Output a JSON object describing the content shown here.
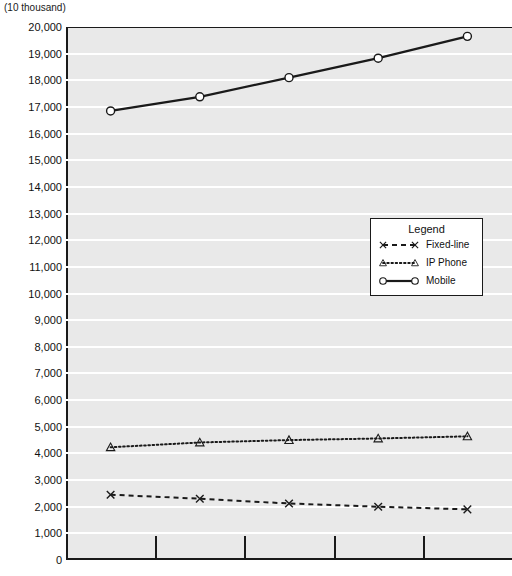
{
  "axis_unit_label": "(10 thousand)",
  "legend": {
    "title": "Legend",
    "items": [
      {
        "label": "Fixed-line",
        "marker": "x-marker-icon",
        "line": "dashed"
      },
      {
        "label": "IP Phone",
        "marker": "triangle-marker-icon",
        "line": "dotted"
      },
      {
        "label": "Mobile",
        "marker": "circle-marker-icon",
        "line": "solid"
      }
    ]
  },
  "chart_data": {
    "type": "line",
    "title": "",
    "xlabel": "",
    "ylabel": "(10 thousand)",
    "ylim": [
      0,
      20000
    ],
    "ytick_step": 1000,
    "ytick_labels": [
      "20,000",
      "19,000",
      "18,000",
      "17,000",
      "16,000",
      "15,000",
      "14,000",
      "13,000",
      "12,000",
      "11,000",
      "10,000",
      "9,000",
      "8,000",
      "7,000",
      "6,000",
      "5,000",
      "4,000",
      "3,000",
      "2,000",
      "1,000",
      "0"
    ],
    "grid": true,
    "legend_position": "center-right",
    "x": [
      1,
      2,
      3,
      4,
      5
    ],
    "categories": [
      "",
      "",
      "",
      "",
      ""
    ],
    "series": [
      {
        "name": "Fixed-line",
        "marker": "x",
        "linestyle": "dashed",
        "color": "#1a1a1a",
        "values": [
          2450,
          2300,
          2120,
          2000,
          1900
        ]
      },
      {
        "name": "IP Phone",
        "marker": "triangle",
        "linestyle": "dotted",
        "color": "#1a1a1a",
        "values": [
          4230,
          4410,
          4500,
          4560,
          4640
        ]
      },
      {
        "name": "Mobile",
        "marker": "circle",
        "linestyle": "solid",
        "color": "#1a1a1a",
        "values": [
          16850,
          17380,
          18100,
          18830,
          19650
        ]
      }
    ]
  }
}
